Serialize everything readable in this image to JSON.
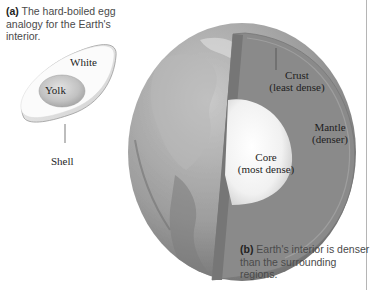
{
  "figure": {
    "panel_a": {
      "letter": "(a)",
      "caption": "The hard-boiled egg analogy for the Earth's interior.",
      "labels": {
        "white": "White",
        "yolk": "Yolk",
        "shell": "Shell"
      }
    },
    "panel_b": {
      "letter": "(b)",
      "caption": "Earth's interior is denser than the surrounding regions.",
      "labels": {
        "crust_name": "Crust",
        "crust_note": "(least dense)",
        "mantle_name": "Mantle",
        "mantle_note": "(denser)",
        "core_name": "Core",
        "core_note": "(most dense)"
      }
    },
    "colors": {
      "background": "#ffffff",
      "mantle": "#8a8a8a",
      "core": "#f4f4f4",
      "globe_surface": "#9a9a9a",
      "egg_white": "#f8f8f8",
      "yolk": "#c8c8c8",
      "text": "#222222"
    }
  }
}
